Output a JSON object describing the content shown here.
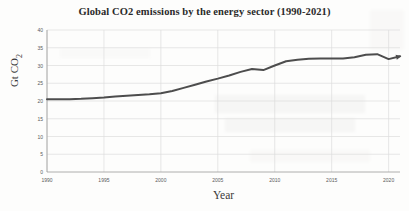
{
  "chart_data": {
    "type": "line",
    "title": "Global CO2 emissions by the energy sector (1990-2021)",
    "xlabel": "Year",
    "ylabel": "Gt CO2",
    "ylabel_base": "Gt CO",
    "ylabel_sub": "2",
    "xlim": [
      1990,
      2021
    ],
    "ylim": [
      0,
      40
    ],
    "ytick_step": 5,
    "xtick_step": 5,
    "grid": true,
    "legend": "none",
    "line_color": "#4d4d4d",
    "line_width": 2,
    "end_marker": "arrowhead",
    "yticks": [
      "40",
      "35",
      "30",
      "25",
      "20",
      "15",
      "10",
      "5",
      "0"
    ],
    "ytick_values": [
      40,
      35,
      30,
      25,
      20,
      15,
      10,
      5,
      0
    ],
    "xticks": [
      "1990",
      "1995",
      "2000",
      "2005",
      "2010",
      "2015",
      "2020"
    ],
    "xtick_values": [
      1990,
      1995,
      2000,
      2005,
      2010,
      2015,
      2020
    ],
    "x": [
      1990,
      1991,
      1992,
      1993,
      1994,
      1995,
      1996,
      1997,
      1998,
      1999,
      2000,
      2001,
      2002,
      2003,
      2004,
      2005,
      2006,
      2007,
      2008,
      2009,
      2010,
      2011,
      2012,
      2013,
      2014,
      2015,
      2016,
      2017,
      2018,
      2019,
      2020,
      2021
    ],
    "values": [
      20.5,
      20.5,
      20.5,
      20.6,
      20.8,
      21.0,
      21.3,
      21.5,
      21.7,
      21.9,
      22.2,
      22.8,
      23.7,
      24.6,
      25.5,
      26.3,
      27.2,
      28.2,
      29.0,
      28.7,
      30.0,
      31.2,
      31.6,
      31.9,
      32.0,
      32.0,
      32.0,
      32.3,
      33.0,
      33.2,
      31.8,
      32.6
    ],
    "series_name": "Global CO2 emissions"
  }
}
